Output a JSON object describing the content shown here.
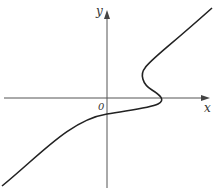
{
  "diagram": {
    "type": "function-curve-sketch",
    "axes": {
      "x_label": "x",
      "y_label": "y",
      "origin_label": "0"
    },
    "curve": {
      "description": "Increasing curve from lower-left crossing y-axis below origin, flattening to the right, folding back (S-shaped turn) just right of origin near the x-axis, then rising to upper-right",
      "color": "#222222"
    },
    "colors": {
      "axis": "#555555",
      "background": "#ffffff"
    }
  }
}
